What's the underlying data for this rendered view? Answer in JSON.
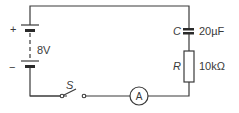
{
  "diagram": {
    "type": "circuit",
    "battery": {
      "voltage_label": "8V",
      "plus_label": "+",
      "minus_label": "−"
    },
    "capacitor": {
      "symbol": "C",
      "value": "20µF"
    },
    "resistor": {
      "symbol": "R",
      "value": "10kΩ"
    },
    "switch": {
      "symbol": "S"
    },
    "ammeter": {
      "symbol": "A"
    },
    "colors": {
      "line": "#3a3a3a",
      "background": "#ffffff"
    }
  }
}
